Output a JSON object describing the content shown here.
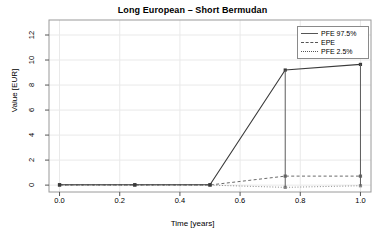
{
  "chart_data": {
    "type": "line",
    "title": "Long European – Short Bermudan",
    "xlabel": "Time [years]",
    "ylabel": "Value [EUR]",
    "xlim": [
      -0.035,
      1.035
    ],
    "ylim": [
      -0.55,
      13.2
    ],
    "xticks": [
      "0.0",
      "0.2",
      "0.4",
      "0.6",
      "0.8",
      "1.0"
    ],
    "xtick_values": [
      0.0,
      0.2,
      0.4,
      0.6,
      0.8,
      1.0
    ],
    "yticks": [
      "0",
      "2",
      "4",
      "6",
      "8",
      "10",
      "12"
    ],
    "ytick_values": [
      0,
      2,
      4,
      6,
      8,
      10,
      12
    ],
    "grid": true,
    "grid_color": "#e9e9e9",
    "legend_position": "top-right",
    "x": [
      0.0,
      0.25,
      0.5,
      0.75,
      1.0
    ],
    "series": [
      {
        "name": "PFE 97.5%",
        "style": "solid",
        "color": "#3a3a3a",
        "marker": "square",
        "values": [
          0.03,
          0.03,
          0.03,
          9.2,
          9.65
        ]
      },
      {
        "name": "EPE",
        "style": "dashed",
        "color": "#6a6a6a",
        "marker": "square",
        "values": [
          0.01,
          0.01,
          0.01,
          0.72,
          0.72
        ]
      },
      {
        "name": "PFE 2.5%",
        "style": "dotted",
        "color": "#8a8a8a",
        "marker": "square",
        "values": [
          0.0,
          0.0,
          0.0,
          -0.18,
          -0.05
        ]
      }
    ]
  },
  "legend": {
    "entries": [
      {
        "label": "PFE 97.5%",
        "style": "solid"
      },
      {
        "label": "EPE",
        "style": "dashed"
      },
      {
        "label": "PFE 2.5%",
        "style": "dotted"
      }
    ]
  }
}
